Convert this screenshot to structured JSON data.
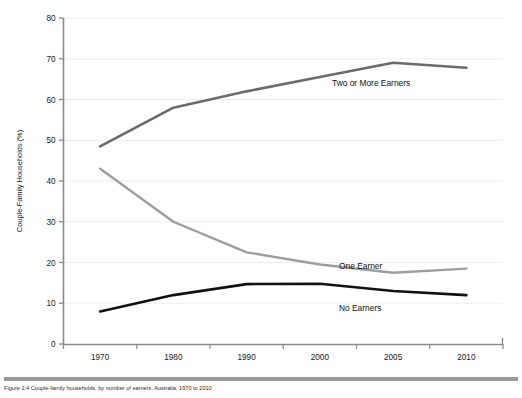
{
  "figure": {
    "caption": "Figure 2.4  Couple-family households, by number of earners, Australia, 1970 to 2010"
  },
  "chart_data": {
    "type": "line",
    "title": "",
    "xlabel": "",
    "ylabel": "Couple-Family Households (%)",
    "categories": [
      "1970",
      "1980",
      "1990",
      "2000",
      "2005",
      "2010"
    ],
    "ylim": [
      0,
      80
    ],
    "yticks": [
      0,
      10,
      20,
      30,
      40,
      50,
      60,
      70,
      80
    ],
    "ytick_labels": [
      "0",
      "10",
      "20",
      "30",
      "40",
      "50",
      "60",
      "70",
      "80"
    ],
    "grid": "horizontal",
    "legend": "inline-labels",
    "series": [
      {
        "name": "Two or More Earners",
        "color": "#6b6b6b",
        "width": 2.6,
        "values": [
          48.5,
          58.0,
          62.0,
          65.5,
          69.0,
          67.8
        ],
        "label_x": 332,
        "label_y": 86
      },
      {
        "name": "One Earner",
        "color": "#9e9e9e",
        "width": 2.4,
        "values": [
          43.0,
          30.0,
          22.5,
          19.5,
          17.5,
          18.5
        ],
        "label_x": 339,
        "label_y": 269
      },
      {
        "name": "No Earners",
        "color": "#111111",
        "width": 2.6,
        "values": [
          8.0,
          12.0,
          14.7,
          14.8,
          13.0,
          12.0
        ],
        "label_x": 339,
        "label_y": 311
      }
    ]
  },
  "colors": {
    "axis": "#8a8a8a",
    "grid": "#ededed",
    "rule": "#9b9b9b",
    "background": "#ffffff"
  }
}
